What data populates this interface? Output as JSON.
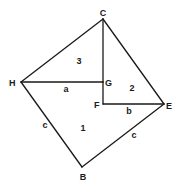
{
  "diagram": {
    "title": "",
    "vertices": [
      {
        "id": "C",
        "label": "C"
      },
      {
        "id": "H",
        "label": "H"
      },
      {
        "id": "G",
        "label": "G"
      },
      {
        "id": "F",
        "label": "F"
      },
      {
        "id": "E",
        "label": "E"
      },
      {
        "id": "B",
        "label": "B"
      }
    ],
    "edges": [
      {
        "from": "C",
        "to": "H"
      },
      {
        "from": "C",
        "to": "E"
      },
      {
        "from": "C",
        "to": "G"
      },
      {
        "from": "G",
        "to": "F"
      },
      {
        "from": "H",
        "to": "G",
        "label": "a"
      },
      {
        "from": "F",
        "to": "E",
        "label": "b"
      },
      {
        "from": "H",
        "to": "B",
        "label": "c"
      },
      {
        "from": "B",
        "to": "E",
        "label": "c"
      }
    ],
    "regions": [
      {
        "id": "region-3",
        "label": "3"
      },
      {
        "id": "region-2",
        "label": "2"
      },
      {
        "id": "region-1",
        "label": "1"
      }
    ]
  }
}
